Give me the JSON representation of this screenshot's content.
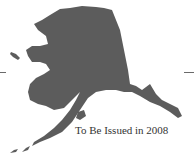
{
  "figure": {
    "caption": "To Be Issued in 2008",
    "fill_color": "#5c5c5c"
  }
}
